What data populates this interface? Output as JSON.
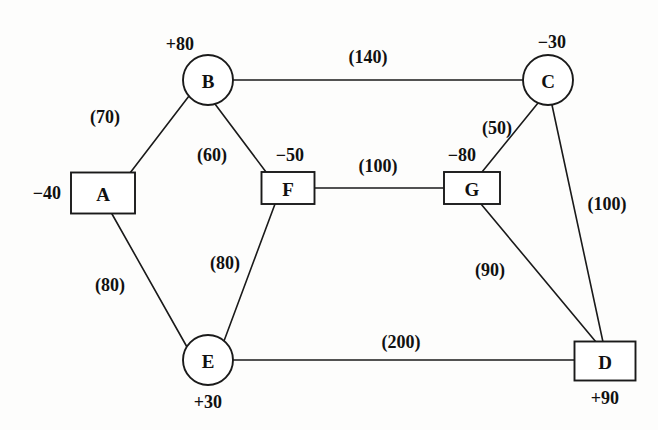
{
  "diagram": {
    "type": "node-arc-network",
    "width": 658,
    "height": 430,
    "background_color": "#fdfdfc",
    "line_color": "#1a1a1a",
    "text_color": "#111111"
  },
  "nodes": [
    {
      "id": "A",
      "label": "A",
      "shape": "rect",
      "x": 103,
      "y": 193,
      "w": 64,
      "h": 41,
      "supply": "−40",
      "supply_value": -40,
      "supply_x": 47,
      "supply_y": 193
    },
    {
      "id": "B",
      "label": "B",
      "shape": "circle",
      "x": 208,
      "y": 80,
      "r": 25,
      "supply": "+80",
      "supply_value": 80,
      "supply_x": 180,
      "supply_y": 44
    },
    {
      "id": "C",
      "label": "C",
      "shape": "circle",
      "x": 548,
      "y": 80,
      "r": 25,
      "supply": "−30",
      "supply_value": -30,
      "supply_x": 552,
      "supply_y": 42
    },
    {
      "id": "D",
      "label": "D",
      "shape": "rect",
      "x": 605,
      "y": 361,
      "w": 61,
      "h": 39,
      "supply": "+90",
      "supply_value": 90,
      "supply_x": 605,
      "supply_y": 398
    },
    {
      "id": "E",
      "label": "E",
      "shape": "circle",
      "x": 208,
      "y": 360,
      "r": 25,
      "supply": "+30",
      "supply_value": 30,
      "supply_x": 208,
      "supply_y": 402
    },
    {
      "id": "F",
      "label": "F",
      "shape": "rect",
      "x": 288,
      "y": 188,
      "w": 53,
      "h": 32,
      "supply": "−50",
      "supply_value": -50,
      "supply_x": 290,
      "supply_y": 155
    },
    {
      "id": "G",
      "label": "G",
      "shape": "rect",
      "x": 472,
      "y": 188,
      "w": 56,
      "h": 32,
      "supply": "−80",
      "supply_value": -80,
      "supply_x": 462,
      "supply_y": 155
    }
  ],
  "edges": [
    {
      "from": "A",
      "to": "B",
      "label": "(70)",
      "value": 70,
      "x1": 130,
      "y1": 173,
      "x2": 189,
      "y2": 96,
      "label_x": 105,
      "label_y": 117
    },
    {
      "from": "B",
      "to": "C",
      "label": "(140)",
      "value": 140,
      "x1": 233,
      "y1": 80,
      "x2": 523,
      "y2": 80,
      "label_x": 368,
      "label_y": 57
    },
    {
      "from": "B",
      "to": "F",
      "label": "(60)",
      "value": 60,
      "x1": 215,
      "y1": 104,
      "x2": 266,
      "y2": 172,
      "label_x": 212,
      "label_y": 155
    },
    {
      "from": "A",
      "to": "E",
      "label": "(80)",
      "value": 80,
      "x1": 112,
      "y1": 214,
      "x2": 187,
      "y2": 347,
      "label_x": 110,
      "label_y": 285
    },
    {
      "from": "E",
      "to": "F",
      "label": "(80)",
      "value": 80,
      "x1": 224,
      "y1": 341,
      "x2": 275,
      "y2": 204,
      "label_x": 225,
      "label_y": 263
    },
    {
      "from": "F",
      "to": "G",
      "label": "(100)",
      "value": 100,
      "x1": 315,
      "y1": 188,
      "x2": 444,
      "y2": 188,
      "label_x": 378,
      "label_y": 166
    },
    {
      "from": "G",
      "to": "C",
      "label": "(50)",
      "value": 50,
      "x1": 482,
      "y1": 172,
      "x2": 538,
      "y2": 103,
      "label_x": 497,
      "label_y": 128
    },
    {
      "from": "C",
      "to": "D",
      "label": "(100)",
      "value": 100,
      "x1": 552,
      "y1": 105,
      "x2": 603,
      "y2": 342,
      "label_x": 607,
      "label_y": 204
    },
    {
      "from": "G",
      "to": "D",
      "label": "(90)",
      "value": 90,
      "x1": 481,
      "y1": 204,
      "x2": 596,
      "y2": 342,
      "label_x": 490,
      "label_y": 270
    },
    {
      "from": "E",
      "to": "D",
      "label": "(200)",
      "value": 200,
      "x1": 233,
      "y1": 360,
      "x2": 575,
      "y2": 360,
      "label_x": 401,
      "label_y": 342
    }
  ]
}
